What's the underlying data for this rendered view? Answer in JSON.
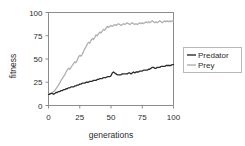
{
  "chart_data": {
    "type": "line",
    "title": "",
    "xlabel": "generations",
    "ylabel": "fitness",
    "xlim": [
      0,
      100
    ],
    "ylim": [
      0,
      100
    ],
    "xticks": [
      0,
      25,
      50,
      75,
      100
    ],
    "yticks": [
      0,
      25,
      50,
      75,
      100
    ],
    "xtick_labels": [
      "0",
      "25",
      "50",
      "75",
      "100"
    ],
    "ytick_labels": [
      "0",
      "25",
      "50",
      "75",
      "100"
    ],
    "grid": false,
    "legend_position": "right",
    "colors": {
      "predator": "#2b2b2b",
      "prey": "#b0b0b0",
      "axis": "#8c8c8c",
      "text": "#2b2b2b",
      "legend_border": "#b8b8b8"
    },
    "x": [
      0,
      1,
      2,
      3,
      4,
      5,
      6,
      7,
      8,
      9,
      10,
      11,
      12,
      13,
      14,
      15,
      16,
      17,
      18,
      19,
      20,
      21,
      22,
      23,
      24,
      25,
      26,
      27,
      28,
      29,
      30,
      31,
      32,
      33,
      34,
      35,
      36,
      37,
      38,
      39,
      40,
      41,
      42,
      43,
      44,
      45,
      46,
      47,
      48,
      49,
      50,
      51,
      52,
      53,
      54,
      55,
      56,
      57,
      58,
      59,
      60,
      61,
      62,
      63,
      64,
      65,
      66,
      67,
      68,
      69,
      70,
      71,
      72,
      73,
      74,
      75,
      76,
      77,
      78,
      79,
      80,
      81,
      82,
      83,
      84,
      85,
      86,
      87,
      88,
      89,
      90,
      91,
      92,
      93,
      94,
      95,
      96,
      97,
      98,
      99,
      100
    ],
    "series": [
      {
        "name": "Predator",
        "color": "#2b2b2b",
        "values": [
          12,
          12,
          13,
          13,
          12,
          13,
          14,
          14,
          15,
          15,
          16,
          16,
          17,
          17,
          18,
          18,
          19,
          19,
          20,
          20,
          20,
          21,
          21,
          22,
          22,
          23,
          23,
          24,
          24,
          24,
          25,
          25,
          25,
          26,
          26,
          26,
          27,
          27,
          27,
          28,
          28,
          29,
          29,
          29,
          30,
          30,
          30,
          31,
          31,
          31,
          32,
          35,
          36,
          35,
          34,
          33,
          33,
          33,
          33,
          34,
          34,
          34,
          34,
          34,
          35,
          35,
          34,
          35,
          36,
          35,
          36,
          36,
          36,
          37,
          37,
          37,
          38,
          38,
          38,
          38,
          39,
          39,
          40,
          41,
          41,
          40,
          40,
          41,
          41,
          41,
          42,
          42,
          42,
          42,
          43,
          43,
          43,
          43,
          43,
          44,
          44
        ]
      },
      {
        "name": "Prey",
        "color": "#b0b0b0",
        "values": [
          12,
          13,
          13,
          14,
          15,
          16,
          18,
          20,
          22,
          24,
          27,
          29,
          31,
          33,
          36,
          38,
          40,
          39,
          41,
          43,
          45,
          47,
          46,
          49,
          52,
          54,
          53,
          55,
          58,
          61,
          63,
          66,
          68,
          67,
          70,
          72,
          71,
          73,
          76,
          75,
          77,
          79,
          78,
          80,
          82,
          81,
          83,
          85,
          84,
          85,
          86,
          85,
          86,
          87,
          86,
          87,
          88,
          87,
          86,
          87,
          88,
          87,
          88,
          89,
          88,
          87,
          88,
          89,
          88,
          87,
          88,
          87,
          88,
          89,
          88,
          89,
          88,
          89,
          90,
          89,
          90,
          89,
          90,
          91,
          90,
          89,
          90,
          89,
          90,
          91,
          90,
          89,
          90,
          91,
          90,
          91,
          90,
          91,
          90,
          91,
          91
        ]
      }
    ]
  },
  "legend": {
    "items": [
      {
        "label": "Predator",
        "color": "#2b2b2b"
      },
      {
        "label": "Prey",
        "color": "#b0b0b0"
      }
    ]
  }
}
